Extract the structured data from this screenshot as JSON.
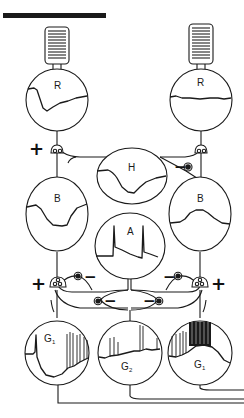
{
  "diagram": {
    "type": "retinal-circuit",
    "colors": {
      "ink": "#1a1a1a",
      "background": "#ffffff"
    },
    "stimulus_bar": {
      "label": ""
    },
    "cells": {
      "receptor_left": {
        "label": "R",
        "response": "hyperpolarizing"
      },
      "receptor_right": {
        "label": "R",
        "response": "flat"
      },
      "horizontal": {
        "label": "H",
        "response": "hyperpolarizing"
      },
      "bipolar_left": {
        "label": "B",
        "response": "hyperpolarizing"
      },
      "bipolar_right": {
        "label": "B",
        "response": "depolarizing"
      },
      "amacrine": {
        "label": "A",
        "response": "transient"
      },
      "ganglion_left": {
        "label": "G",
        "sub": "1",
        "response": "off-spikes"
      },
      "ganglion_middle": {
        "label": "G",
        "sub": "2",
        "response": "on-off-spikes"
      },
      "ganglion_right": {
        "label": "G",
        "sub": "1",
        "response": "on-spikes"
      }
    },
    "synapse_signs": {
      "receptor_left_to_bipolar": "+",
      "horizontal_to_bipolar_right": "−",
      "bipolar_left_to_ganglion": "+",
      "bipolar_left_inhibit": "−",
      "bipolar_right_inhibit": "−",
      "bipolar_right_to_ganglion": "+",
      "amacrine_left": "−",
      "amacrine_right": "−"
    }
  }
}
